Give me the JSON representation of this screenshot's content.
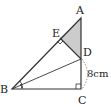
{
  "diagram": {
    "type": "geometry-figure",
    "points": {
      "A": {
        "label": "A",
        "x": 81,
        "y": 18
      },
      "B": {
        "label": "B",
        "x": 12,
        "y": 89
      },
      "C": {
        "label": "C",
        "x": 81,
        "y": 89
      },
      "D": {
        "label": "D",
        "x": 81,
        "y": 59
      },
      "E": {
        "label": "E",
        "x": 60,
        "y": 38
      }
    },
    "measurement": {
      "label": "8cm",
      "segment": "DC"
    },
    "shaded_region": "triangle AED",
    "right_angles": [
      "E",
      "C"
    ],
    "angle_bisector": "BD",
    "colors": {
      "stroke": "#333333",
      "shade": "#cccccc",
      "background": "#ffffff"
    }
  }
}
